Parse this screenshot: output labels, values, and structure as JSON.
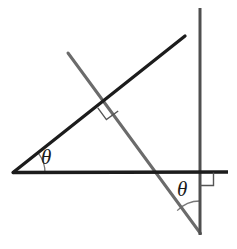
{
  "figure": {
    "kind": "geometry-diagram",
    "background_color": "#ffffff",
    "colors": {
      "primary_line": "#1c1c1c",
      "secondary_line": "#6b6b6b",
      "mark": "#555555",
      "label": "#1a1a1a"
    },
    "labels": {
      "theta_left": "θ",
      "theta_right": "θ"
    },
    "elements": {
      "horizontal_baseline": {
        "name": "horizontal-baseline",
        "x1": 13,
        "y1": 173,
        "x2": 228,
        "y2": 172,
        "color": "#1c1c1c",
        "width": 3.2
      },
      "rising_ray": {
        "name": "rising-ray",
        "x1": 13,
        "y1": 173,
        "x2": 185,
        "y2": 36,
        "color": "#1c1c1c",
        "width": 3.2
      },
      "transversal": {
        "name": "transversal-line",
        "x1": 68,
        "y1": 53,
        "x2": 200,
        "y2": 233,
        "color": "#6b6b6b",
        "width": 3.0
      },
      "vertical_line": {
        "name": "vertical-line",
        "x1": 200,
        "y1": 8,
        "x2": 200,
        "y2": 235,
        "color": "#4a4a4a",
        "width": 3.0
      }
    },
    "marks": {
      "right_angle_center": {
        "name": "right-angle-mark-intersection",
        "vertex_x": 106,
        "vertex_y": 101,
        "size": 13
      },
      "right_angle_axes": {
        "name": "right-angle-mark-axes",
        "vertex_x": 200,
        "vertex_y": 172,
        "size": 13
      },
      "arc_left": {
        "name": "angle-arc-left",
        "vertex_x": 13,
        "vertex_y": 173,
        "radius": 32
      },
      "arc_right": {
        "name": "angle-arc-right",
        "vertex_x": 200,
        "vertex_y": 233,
        "radius": 32
      }
    }
  }
}
